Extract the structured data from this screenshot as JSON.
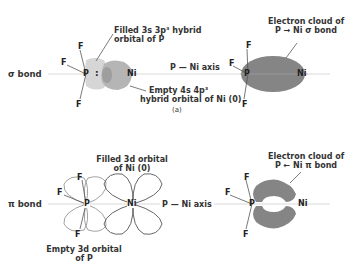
{
  "panel_a": {
    "row_label": "σ bond",
    "caption": "(a)",
    "left_diagram": {
      "atoms": {
        "p": "P",
        "ni": "Ni",
        "f1": "F",
        "f2": "F",
        "f3": "F"
      },
      "lone_pair": ":",
      "label_filled": [
        "Filled 3s 3p³ hybrid",
        "orbital of P"
      ],
      "label_empty": [
        "Empty 4s 4p³",
        "hybrid orbital of Ni (0)"
      ]
    },
    "axis_label": "P — Ni axis",
    "right_diagram": {
      "atoms": {
        "p": "P",
        "ni": "Ni",
        "f1": "F",
        "f2": "F",
        "f3": "F"
      },
      "label": [
        "Electron cloud of",
        "P → Ni σ bond"
      ]
    },
    "colors": {
      "p_orbital": "#d4d4d4",
      "ni_orbital": "#b4b4b4",
      "cloud": "#858585",
      "axis": "#c8c8c8"
    }
  },
  "panel_b": {
    "row_label": "π bond",
    "left_diagram": {
      "atoms": {
        "p": "P",
        "ni": "Ni",
        "f1": "F",
        "f2": "F",
        "f3": "F"
      },
      "label_filled": [
        "Filled 3d orbital",
        "of Ni (0)"
      ],
      "label_empty": [
        "Empty 3d orbital",
        "of P"
      ]
    },
    "axis_label": "P — Ni axis",
    "right_diagram": {
      "atoms": {
        "p": "P",
        "ni": "Ni",
        "f1": "F",
        "f2": "F",
        "f3": "F"
      },
      "label": [
        "Electron cloud of",
        "P ← Ni π bond"
      ]
    },
    "colors": {
      "lobe_outline": "#666666",
      "cloud": "#858585"
    }
  }
}
